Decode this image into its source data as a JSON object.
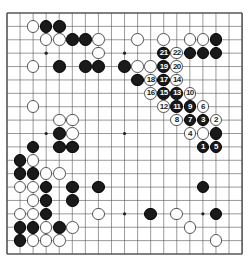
{
  "board": {
    "size": 19,
    "origin_px": [
      7,
      13
    ],
    "spacing_px": [
      13.06,
      13.39
    ],
    "line_color": "#555555",
    "star_points": [
      [
        3,
        3
      ],
      [
        9,
        3
      ],
      [
        15,
        3
      ],
      [
        3,
        9
      ],
      [
        9,
        9
      ],
      [
        15,
        9
      ],
      [
        3,
        15
      ],
      [
        9,
        15
      ],
      [
        15,
        15
      ]
    ]
  },
  "stones": {
    "white": [
      [
        2,
        1
      ],
      [
        3,
        2
      ],
      [
        4,
        2
      ],
      [
        7,
        2
      ],
      [
        7,
        3
      ],
      [
        2,
        4
      ],
      [
        10,
        2
      ],
      [
        12,
        2
      ],
      [
        14,
        2
      ],
      [
        15,
        2
      ],
      [
        10,
        4
      ],
      [
        11,
        4
      ],
      [
        2,
        7
      ],
      [
        4,
        8
      ],
      [
        5,
        8
      ],
      [
        5,
        9
      ],
      [
        15,
        9
      ],
      [
        2,
        11
      ],
      [
        3,
        12
      ],
      [
        4,
        12
      ],
      [
        1,
        13
      ],
      [
        2,
        13
      ],
      [
        2,
        14
      ],
      [
        1,
        15
      ],
      [
        2,
        15
      ],
      [
        7,
        15
      ],
      [
        3,
        16
      ],
      [
        5,
        16
      ],
      [
        2,
        17
      ],
      [
        3,
        17
      ],
      [
        4,
        17
      ],
      [
        13,
        15
      ],
      [
        14,
        16
      ],
      [
        16,
        17
      ]
    ],
    "black": [
      [
        3,
        1
      ],
      [
        4,
        1
      ],
      [
        5,
        2
      ],
      [
        6,
        2
      ],
      [
        4,
        4
      ],
      [
        6,
        4
      ],
      [
        7,
        4
      ],
      [
        9,
        4
      ],
      [
        16,
        2
      ],
      [
        14,
        3
      ],
      [
        15,
        3
      ],
      [
        16,
        3
      ],
      [
        10,
        5
      ],
      [
        16,
        9
      ],
      [
        4,
        9
      ],
      [
        2,
        10
      ],
      [
        4,
        10
      ],
      [
        5,
        10
      ],
      [
        1,
        11
      ],
      [
        1,
        12
      ],
      [
        2,
        12
      ],
      [
        3,
        13
      ],
      [
        5,
        13
      ],
      [
        7,
        13
      ],
      [
        3,
        14
      ],
      [
        5,
        14
      ],
      [
        3,
        15
      ],
      [
        1,
        16
      ],
      [
        2,
        16
      ],
      [
        4,
        16
      ],
      [
        1,
        17
      ],
      [
        15,
        13
      ],
      [
        11,
        15
      ],
      [
        16,
        15
      ]
    ]
  },
  "moves": [
    {
      "n": "1",
      "color": "black",
      "pos": [
        15,
        10
      ]
    },
    {
      "n": "2",
      "color": "white",
      "pos": [
        16,
        8
      ]
    },
    {
      "n": "3",
      "color": "black",
      "pos": [
        15,
        8
      ]
    },
    {
      "n": "4",
      "color": "white",
      "pos": [
        14,
        9
      ]
    },
    {
      "n": "5",
      "color": "black",
      "pos": [
        16,
        10
      ]
    },
    {
      "n": "6",
      "color": "white",
      "pos": [
        15,
        7
      ]
    },
    {
      "n": "7",
      "color": "black",
      "pos": [
        14,
        8
      ]
    },
    {
      "n": "8",
      "color": "white",
      "pos": [
        13,
        8
      ]
    },
    {
      "n": "9",
      "color": "black",
      "pos": [
        14,
        7
      ]
    },
    {
      "n": "10",
      "color": "white",
      "pos": [
        14,
        6
      ]
    },
    {
      "n": "11",
      "color": "black",
      "pos": [
        13,
        7
      ]
    },
    {
      "n": "12",
      "color": "white",
      "pos": [
        12,
        7
      ]
    },
    {
      "n": "13",
      "color": "black",
      "pos": [
        13,
        6
      ]
    },
    {
      "n": "14",
      "color": "white",
      "pos": [
        13,
        5
      ]
    },
    {
      "n": "15",
      "color": "black",
      "pos": [
        12,
        6
      ]
    },
    {
      "n": "16",
      "color": "white",
      "pos": [
        11,
        6
      ]
    },
    {
      "n": "17",
      "color": "black",
      "pos": [
        12,
        5
      ]
    },
    {
      "n": "18",
      "color": "white",
      "pos": [
        11,
        5
      ]
    },
    {
      "n": "19",
      "color": "black",
      "pos": [
        12,
        4
      ]
    },
    {
      "n": "20",
      "color": "white",
      "pos": [
        13,
        4
      ]
    },
    {
      "n": "21",
      "color": "black",
      "pos": [
        12,
        3
      ]
    },
    {
      "n": "22",
      "color": "white",
      "pos": [
        13,
        3
      ]
    }
  ]
}
